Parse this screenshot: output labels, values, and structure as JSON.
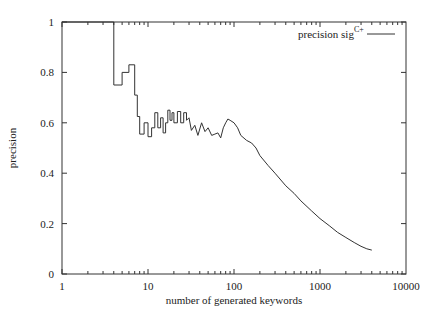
{
  "chart_data": {
    "type": "line",
    "title": "",
    "xlabel": "number of generated keywords",
    "ylabel": "precision",
    "xscale": "log",
    "xlim": [
      1,
      10000
    ],
    "ylim": [
      0,
      1
    ],
    "xticks": [
      "1",
      "10",
      "100",
      "1000",
      "10000"
    ],
    "yticks": [
      "0",
      "0.2",
      "0.4",
      "0.6",
      "0.8",
      "1"
    ],
    "grid": false,
    "legend_position": "top-right",
    "series": [
      {
        "name": "precision sig",
        "name_superscript": "C+",
        "style": "step",
        "x": [
          1,
          4,
          4,
          5,
          5,
          6,
          6,
          7,
          7,
          7.5,
          7.5,
          8,
          8,
          9,
          9,
          10,
          10,
          11,
          11,
          12,
          12,
          13,
          13,
          14,
          14,
          15,
          15,
          16,
          16,
          17,
          17,
          18,
          18,
          19,
          19,
          20,
          20,
          22,
          22,
          24,
          24,
          26,
          26,
          28,
          28,
          30,
          32,
          35,
          38,
          42,
          46,
          50,
          55,
          60,
          65,
          70,
          75,
          80,
          85,
          90,
          100,
          110,
          120,
          140,
          160,
          180,
          200,
          250,
          300,
          400,
          500,
          600,
          800,
          1000,
          1300,
          1600,
          2000,
          2500,
          3000,
          3500,
          4000
        ],
        "y": [
          1,
          1,
          0.75,
          0.75,
          0.8,
          0.8,
          0.83,
          0.83,
          0.71,
          0.71,
          0.625,
          0.625,
          0.555,
          0.555,
          0.6,
          0.6,
          0.545,
          0.545,
          0.58,
          0.58,
          0.64,
          0.64,
          0.58,
          0.58,
          0.62,
          0.62,
          0.56,
          0.56,
          0.6,
          0.6,
          0.65,
          0.65,
          0.61,
          0.61,
          0.64,
          0.64,
          0.6,
          0.6,
          0.645,
          0.645,
          0.6,
          0.6,
          0.64,
          0.64,
          0.61,
          0.62,
          0.57,
          0.59,
          0.55,
          0.6,
          0.565,
          0.58,
          0.55,
          0.555,
          0.56,
          0.54,
          0.58,
          0.6,
          0.615,
          0.61,
          0.6,
          0.58,
          0.55,
          0.53,
          0.52,
          0.5,
          0.47,
          0.43,
          0.4,
          0.35,
          0.32,
          0.29,
          0.25,
          0.22,
          0.19,
          0.165,
          0.145,
          0.125,
          0.11,
          0.1,
          0.095
        ]
      }
    ]
  }
}
